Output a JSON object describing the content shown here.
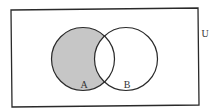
{
  "diagram": {
    "type": "venn",
    "universe": {
      "label": "U",
      "corners": [
        [
          11,
          10
        ],
        [
          198,
          8
        ],
        [
          199,
          105
        ],
        [
          12,
          107
        ]
      ]
    },
    "sets": [
      {
        "label": "A",
        "cx": 83,
        "cy": 59,
        "r": 31.5
      },
      {
        "label": "B",
        "cx": 126,
        "cy": 59,
        "r": 31.5
      }
    ],
    "shaded_region": "A minus B",
    "colors": {
      "stroke": "#2a2a2a",
      "shade": "#c6c6c6",
      "background": "#ffffff"
    }
  }
}
